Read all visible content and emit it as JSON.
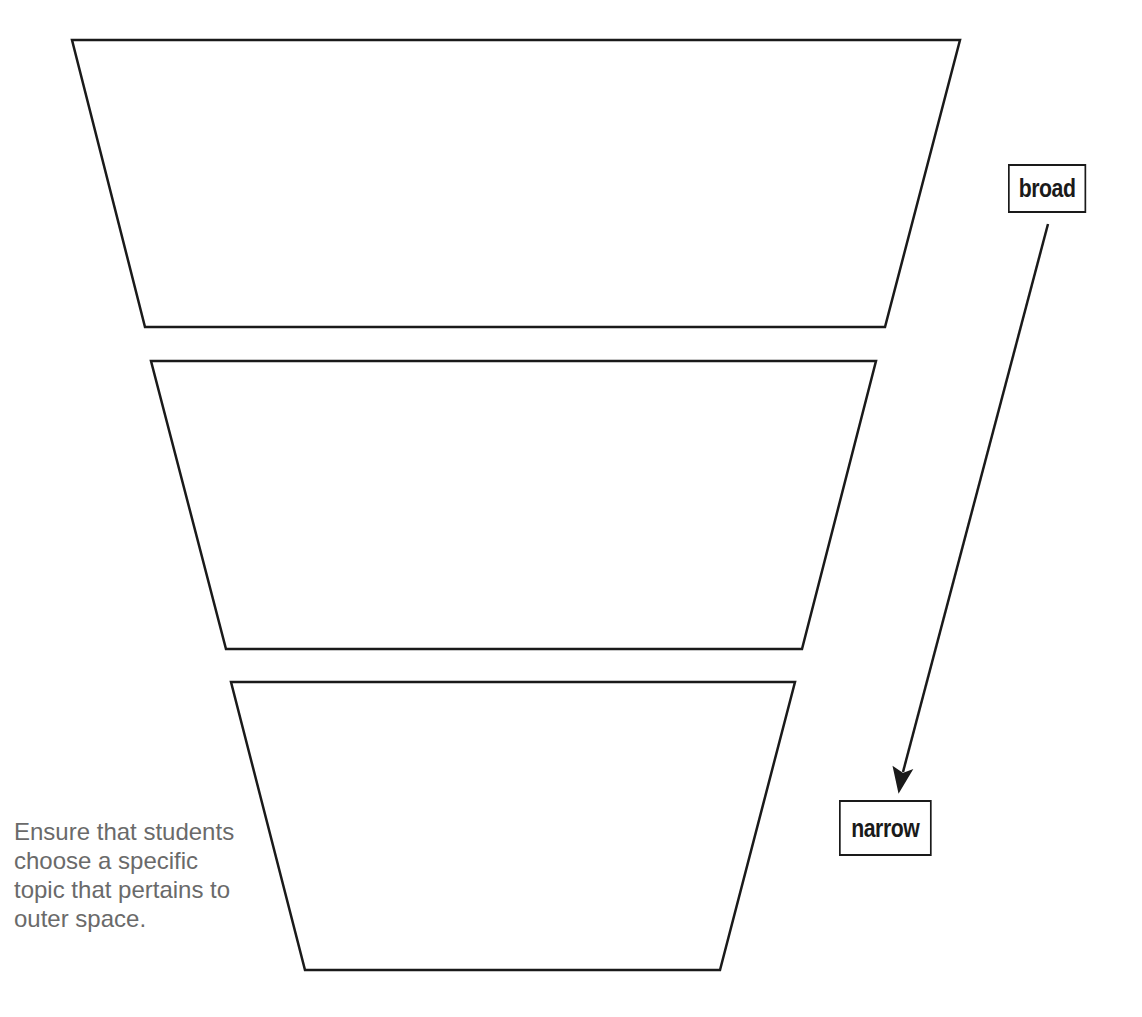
{
  "diagram": {
    "type": "funnel",
    "levels": [
      {
        "name": "top",
        "text": ""
      },
      {
        "name": "middle",
        "text": ""
      },
      {
        "name": "bottom",
        "text": ""
      }
    ],
    "labels": {
      "broad": "broad",
      "narrow": "narrow"
    },
    "note": "Ensure that students choose a specific topic that pertains to outer space.",
    "colors": {
      "stroke": "#1a1a1a",
      "note_text": "#6a6a6a",
      "background": "#ffffff"
    }
  }
}
